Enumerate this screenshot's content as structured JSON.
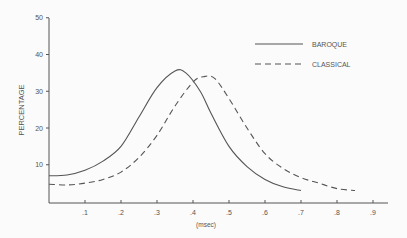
{
  "chart_data": {
    "type": "line",
    "title": "",
    "xlabel": "(msec)",
    "ylabel": "PERCENTAGE",
    "xlim": [
      0,
      0.95
    ],
    "ylim": [
      0,
      50
    ],
    "x_ticks": [
      ".1",
      ".2",
      ".3",
      ".4",
      ".5",
      ".6",
      ".7",
      ".8",
      ".9"
    ],
    "y_ticks": [
      "10",
      "20",
      "30",
      "40",
      "50"
    ],
    "grid": false,
    "legend_position": "upper right",
    "series": [
      {
        "name": "BAROQUE",
        "style": "solid",
        "x": [
          0.0,
          0.05,
          0.1,
          0.15,
          0.2,
          0.25,
          0.3,
          0.35,
          0.38,
          0.42,
          0.45,
          0.5,
          0.55,
          0.6,
          0.65,
          0.7
        ],
        "y": [
          7,
          7.2,
          8.5,
          11,
          15,
          23,
          31,
          35.5,
          35,
          30,
          24,
          15,
          9.5,
          6,
          4,
          3
        ]
      },
      {
        "name": "CLASSICAL",
        "style": "dashed",
        "x": [
          0.0,
          0.05,
          0.1,
          0.15,
          0.2,
          0.25,
          0.3,
          0.35,
          0.4,
          0.43,
          0.46,
          0.5,
          0.55,
          0.6,
          0.65,
          0.7,
          0.75,
          0.8,
          0.85
        ],
        "y": [
          4.7,
          4.5,
          5,
          6,
          8,
          12,
          18,
          26,
          32.5,
          34,
          33.5,
          28,
          20,
          13,
          9,
          6.5,
          5,
          3.5,
          3
        ]
      }
    ]
  }
}
